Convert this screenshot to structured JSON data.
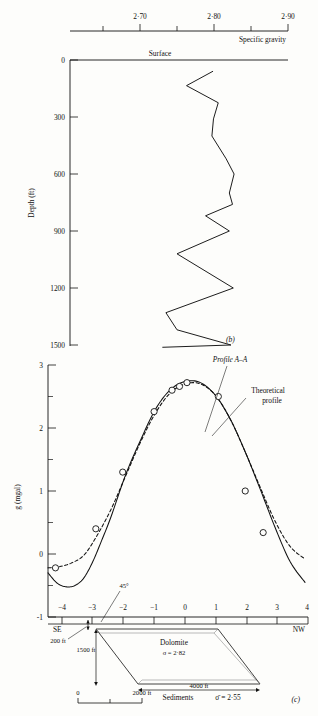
{
  "figure": {
    "panel_b_id": "(b)",
    "panel_c_id": "(c)"
  },
  "density_log": {
    "top_axis": {
      "label": "Specific gravity",
      "ticks": [
        2.65,
        2.7,
        2.75,
        2.8,
        2.85,
        2.9
      ],
      "labeled_ticks": [
        {
          "value": 2.7,
          "text": "2·70"
        },
        {
          "value": 2.8,
          "text": "2·80"
        },
        {
          "value": 2.9,
          "text": "2·90"
        }
      ],
      "range": [
        2.625,
        2.9
      ]
    },
    "surface_label": "Surface",
    "depth_axis": {
      "label": "Depth (ft)",
      "ticks": [
        0,
        300,
        600,
        900,
        1200,
        1500
      ],
      "tick_labels": [
        "0",
        "300",
        "600",
        "900",
        "1200",
        "1500"
      ],
      "range": [
        0,
        1560
      ]
    },
    "chart_data": {
      "type": "line",
      "title": "Specific gravity log versus depth",
      "xlabel": "Specific gravity",
      "ylabel": "Depth (ft)",
      "xlim": [
        2.625,
        2.9
      ],
      "ylim": [
        0,
        1560
      ],
      "grid": false,
      "y_inverted": true,
      "series": [
        {
          "name": "Specific gravity log",
          "points": [
            {
              "depth": 60,
              "sg": 2.805
            },
            {
              "depth": 135,
              "sg": 2.772
            },
            {
              "depth": 225,
              "sg": 2.812
            },
            {
              "depth": 310,
              "sg": 2.806
            },
            {
              "depth": 400,
              "sg": 2.804
            },
            {
              "depth": 520,
              "sg": 2.822
            },
            {
              "depth": 600,
              "sg": 2.832
            },
            {
              "depth": 700,
              "sg": 2.826
            },
            {
              "depth": 760,
              "sg": 2.83
            },
            {
              "depth": 820,
              "sg": 2.796
            },
            {
              "depth": 900,
              "sg": 2.826
            },
            {
              "depth": 1020,
              "sg": 2.76
            },
            {
              "depth": 1200,
              "sg": 2.831
            },
            {
              "depth": 1330,
              "sg": 2.746
            },
            {
              "depth": 1420,
              "sg": 2.76
            },
            {
              "depth": 1500,
              "sg": 2.828
            },
            {
              "depth": 1512,
              "sg": 2.742
            }
          ]
        }
      ]
    }
  },
  "gravity_profile": {
    "y_axis": {
      "label": "g (mgal)",
      "ticks": [
        -1,
        0,
        1,
        2,
        3
      ],
      "tick_labels": [
        "-1",
        "0",
        "1",
        "2",
        "3"
      ],
      "minor_step": 0.5,
      "range": [
        -1,
        3
      ]
    },
    "x_axis": {
      "ticks": [
        -4,
        -3,
        -2,
        -1,
        0,
        1,
        2,
        3,
        4
      ],
      "tick_labels": [
        "−4",
        "−3",
        "−2",
        "−1",
        "0",
        "1",
        "2",
        "3",
        "4"
      ],
      "range": [
        -4.6,
        4.1
      ],
      "left_end_label": "SE",
      "right_end_label": "NW"
    },
    "annotations": [
      {
        "name": "profile-a-a",
        "text": "Profile A–A"
      },
      {
        "name": "theoretical-profile-line1",
        "text": "Theoretical"
      },
      {
        "name": "theoretical-profile-line2",
        "text": "profile"
      },
      {
        "name": "dip-angle",
        "text": "45°"
      }
    ],
    "chart_data": {
      "type": "line",
      "title": "Gravity anomaly profile A-A with theoretical profile",
      "xlabel": "Distance (x1000 ft)",
      "ylabel": "g (mgal)",
      "xlim": [
        -4.6,
        4.1
      ],
      "ylim": [
        -1,
        3
      ],
      "grid": false,
      "series": [
        {
          "name": "Profile A-A (observed, solid)",
          "style": "solid",
          "x": [
            -4.6,
            -4.3,
            -4.0,
            -3.7,
            -3.4,
            -3.1,
            -2.8,
            -2.5,
            -2.0,
            -1.5,
            -1.0,
            -0.5,
            0.0,
            0.5,
            1.0,
            1.5,
            2.0,
            2.5,
            3.0,
            3.5,
            4.0
          ],
          "y": [
            -0.3,
            -0.46,
            -0.52,
            -0.5,
            -0.38,
            -0.12,
            0.22,
            0.58,
            1.26,
            1.81,
            2.3,
            2.61,
            2.74,
            2.72,
            2.52,
            2.14,
            1.62,
            1.03,
            0.42,
            -0.12,
            -0.45
          ]
        },
        {
          "name": "Theoretical profile (dashed)",
          "style": "dashed",
          "x": [
            -4.6,
            -4.2,
            -3.8,
            -3.4,
            -3.0,
            -2.5,
            -2.0,
            -1.5,
            -1.0,
            -0.5,
            0.0,
            0.5,
            1.0,
            1.5,
            2.0,
            2.5,
            3.0,
            3.5,
            4.0
          ],
          "y": [
            -0.22,
            -0.2,
            -0.14,
            -0.02,
            0.26,
            0.7,
            1.24,
            1.78,
            2.24,
            2.56,
            2.7,
            2.7,
            2.52,
            2.14,
            1.62,
            1.06,
            0.52,
            0.12,
            -0.08
          ]
        },
        {
          "name": "Observed stations (circles)",
          "style": "points",
          "x": [
            -4.35,
            -3.0,
            -2.1,
            -1.05,
            -0.45,
            -0.2,
            0.05,
            1.1,
            2.0,
            2.6
          ],
          "y": [
            -0.22,
            0.4,
            1.3,
            2.26,
            2.6,
            2.66,
            2.72,
            2.5,
            1.0,
            0.34
          ]
        }
      ]
    }
  },
  "cross_section": {
    "body_label": "Dolomite",
    "body_density": "σ = 2·82",
    "host_label": "Sediments",
    "host_density": "σ̄ = 2·55",
    "depth_to_top": "200 ft",
    "body_thickness": "1500 ft",
    "body_width": "4000 ft",
    "dip_angle": "45°",
    "scale_bar": {
      "start_label": "0",
      "end_label": "2000 ft",
      "midpoint_tick": true
    }
  }
}
